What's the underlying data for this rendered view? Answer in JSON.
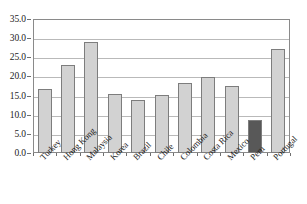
{
  "chart_data": {
    "type": "bar",
    "title": "",
    "subtitle": "",
    "xlabel": "",
    "ylabel": "",
    "ylim": [
      0.0,
      35.0
    ],
    "ytick_labels": [
      "35.0",
      "30.0",
      "25.0",
      "20.0",
      "15.0",
      "10.0",
      "5.0",
      "0.0"
    ],
    "ytick_values": [
      35.0,
      30.0,
      25.0,
      20.0,
      15.0,
      10.0,
      5.0,
      0.0
    ],
    "grid": true,
    "legend": null,
    "categories": [
      "Turkey",
      "Hong Kong",
      "Malaysia",
      "Korea",
      "Brazil",
      "Chile",
      "Colombia",
      "Costa Rica",
      "Mexico",
      "Peru",
      "Portugal"
    ],
    "values": [
      16.7,
      23.1,
      29.1,
      15.3,
      13.8,
      15.1,
      18.3,
      19.8,
      17.4,
      8.6,
      27.1
    ],
    "highlighted_category": "Peru",
    "bar_colors": [
      "#d2d2d2",
      "#d2d2d2",
      "#d2d2d2",
      "#d2d2d2",
      "#d2d2d2",
      "#d2d2d2",
      "#d2d2d2",
      "#d2d2d2",
      "#d2d2d2",
      "#585858",
      "#d2d2d2"
    ]
  },
  "style": {
    "bar_fill": "#d2d2d2",
    "bar_highlight_fill": "#585858",
    "bar_border": "#7d7d7d",
    "gridline_color": "#b9b9b9",
    "frame_color": "#8a8a8a",
    "text_color": "#1b1b1b",
    "background": "#ffffff"
  }
}
